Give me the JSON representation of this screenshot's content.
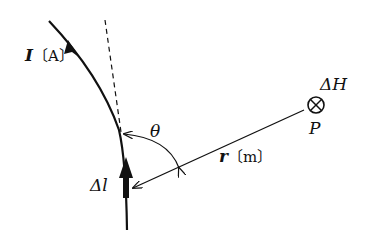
{
  "diagram": {
    "labels": {
      "current": "I",
      "current_unit": "〔A〕",
      "angle": "θ",
      "distance": "r",
      "distance_unit": "〔m〕",
      "element": "Δl",
      "field": "ΔH",
      "point": "P"
    },
    "icons": {
      "field_symbol": "circled-x-into-page"
    },
    "colors": {
      "stroke": "#111111",
      "background": "#ffffff"
    }
  }
}
